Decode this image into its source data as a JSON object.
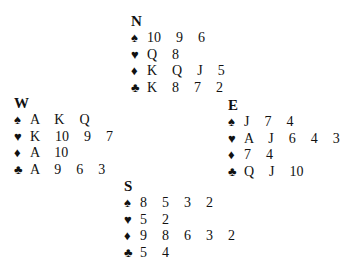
{
  "suits": {
    "spades": "♠",
    "hearts": "♥",
    "diamonds": "♦",
    "clubs": "♣"
  },
  "hands": {
    "north": {
      "seat": "N",
      "spades": "10  9  6",
      "hearts": "Q  8",
      "diamonds": "K  Q  J  5",
      "clubs": "K  8  7  2"
    },
    "west": {
      "seat": "W",
      "spades": "A  K  Q",
      "hearts": "K  10  9  7",
      "diamonds": "A  10",
      "clubs": "A  9  6  3"
    },
    "east": {
      "seat": "E",
      "spades": "J  7  4",
      "hearts": "A  J  6  4  3",
      "diamonds": "7  4",
      "clubs": "Q  J  10"
    },
    "south": {
      "seat": "S",
      "spades": "8  5  3  2",
      "hearts": "5  2",
      "diamonds": "9  8  6  3  2",
      "clubs": "5  4"
    }
  }
}
